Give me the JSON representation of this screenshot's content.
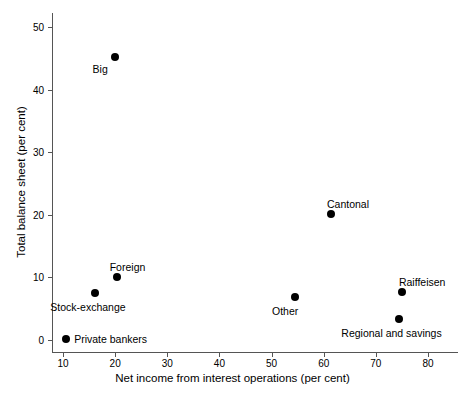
{
  "chart_data": {
    "type": "scatter",
    "title": "",
    "xlabel": "Net income from interest operations (per cent)",
    "ylabel": "Total balance sheet (per cent)",
    "xlim": [
      7.5,
      82
    ],
    "ylim": [
      -1.7,
      52.9
    ],
    "xticks": [
      10,
      20,
      30,
      40,
      50,
      60,
      70,
      80
    ],
    "yticks": [
      0,
      10,
      20,
      30,
      40,
      50
    ],
    "xtick_labels": [
      "10",
      "20",
      "30",
      "40",
      "50",
      "60",
      "70",
      "80"
    ],
    "ytick_labels": [
      "0",
      "10",
      "20",
      "30",
      "40",
      "50"
    ],
    "grid": false,
    "legend": "none",
    "marker_color": "#000000",
    "axis_color": "#555555",
    "points": [
      {
        "label": "Big",
        "x": 19.9,
        "y": 45.2,
        "label_dx": -22,
        "label_dy": 12
      },
      {
        "label": "Foreign",
        "x": 20.3,
        "y": 10.0,
        "label_dx": -7,
        "label_dy": -10
      },
      {
        "label": "Stock-exchange",
        "x": 16.2,
        "y": 7.5,
        "label_dx": -45,
        "label_dy": 14
      },
      {
        "label": "Private bankers",
        "x": 10.6,
        "y": 0.2,
        "label_dx": 8,
        "label_dy": 0
      },
      {
        "label": "Other",
        "x": 54.5,
        "y": 6.8,
        "label_dx": -23,
        "label_dy": 14
      },
      {
        "label": "Cantonal",
        "x": 61.4,
        "y": 20.1,
        "label_dx": -4,
        "label_dy": -10
      },
      {
        "label": "Raiffeisen",
        "x": 75.0,
        "y": 7.7,
        "label_dx": -3,
        "label_dy": -10
      },
      {
        "label": "Regional and savings",
        "x": 74.5,
        "y": 3.4,
        "label_dx": -58,
        "label_dy": 14
      }
    ]
  }
}
